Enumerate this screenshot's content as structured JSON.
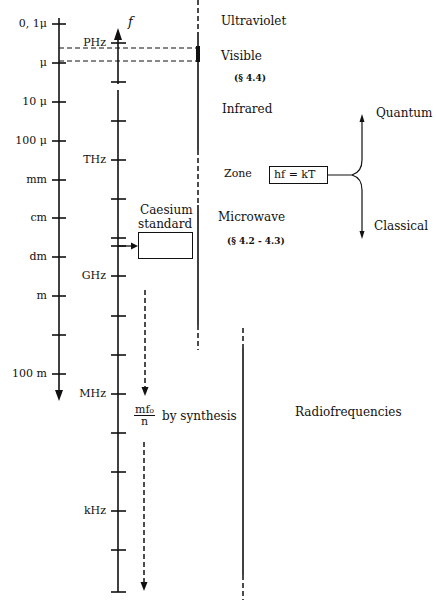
{
  "wavelength_axis": {
    "ticks": [
      {
        "label": "0, 1μ",
        "y": 24
      },
      {
        "label": "μ",
        "y": 63
      },
      {
        "label": "10 μ",
        "y": 102
      },
      {
        "label": "100 μ",
        "y": 141
      },
      {
        "label": "mm",
        "y": 180
      },
      {
        "label": "cm",
        "y": 218
      },
      {
        "label": "dm",
        "y": 257
      },
      {
        "label": "m",
        "y": 296
      },
      {
        "label": "",
        "y": 335
      },
      {
        "label": "100 m",
        "y": 374
      }
    ]
  },
  "frequency_axis": {
    "symbol": "f",
    "labels": {
      "phz": "PHz",
      "thz": "THz",
      "ghz": "GHz",
      "mhz": "MHz",
      "khz": "kHz"
    }
  },
  "regions": {
    "ultraviolet": "Ultraviolet",
    "visible": "Visible",
    "visible_ref": "(§ 4.4)",
    "infrared": "Infrared",
    "zone": "Zone",
    "microwave": "Microwave",
    "microwave_ref": "(§ 4.2 - 4.3)",
    "radiofrequencies": "Radiofrequencies"
  },
  "zone_box": {
    "formula": "hf = kT",
    "quantum": "Quantum",
    "classical": "Classical"
  },
  "caesium": {
    "line1": "Caesium",
    "line2": "standard"
  },
  "synthesis": {
    "numerator": "mf₀",
    "denominator": "n",
    "text": "by synthesis"
  }
}
